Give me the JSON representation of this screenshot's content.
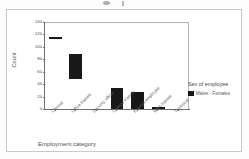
{
  "chart_data": {
    "type": "bar",
    "title": "",
    "xlabel": "Employment category",
    "ylabel": "Count",
    "ylim": [
      0,
      140
    ],
    "yticks": [
      140,
      120,
      100,
      80,
      60,
      40,
      20,
      0
    ],
    "grid": false,
    "legend_position": "right",
    "categories": [
      "Clerical",
      "Office trainee",
      "Security officer",
      "College trainee",
      "Exempt employee",
      "MBA trainee",
      "Technical"
    ],
    "series": [
      {
        "name": "Males - Females",
        "color": "#181818",
        "values": [
          116,
          88,
          0,
          33,
          28,
          3,
          0
        ],
        "bases": [
          113,
          48,
          0,
          0,
          0,
          0,
          0
        ]
      }
    ],
    "legend": {
      "title": "Sex of employee",
      "entries": [
        {
          "label": "Males - Females",
          "color": "#181818"
        }
      ]
    }
  },
  "axis": {
    "y": {
      "title": "Count",
      "ticks": [
        "140",
        "120",
        "100",
        "80",
        "60",
        "40",
        "20",
        "0"
      ]
    },
    "x": {
      "title": "Employment category",
      "ticks": [
        "Clerical",
        "Office trainee",
        "Security officer",
        "College trainee",
        "Exempt employee",
        "MBA trainee",
        "Technical"
      ]
    }
  },
  "legend": {
    "title": "Sex of employee",
    "entry_label": "Males - Females"
  }
}
